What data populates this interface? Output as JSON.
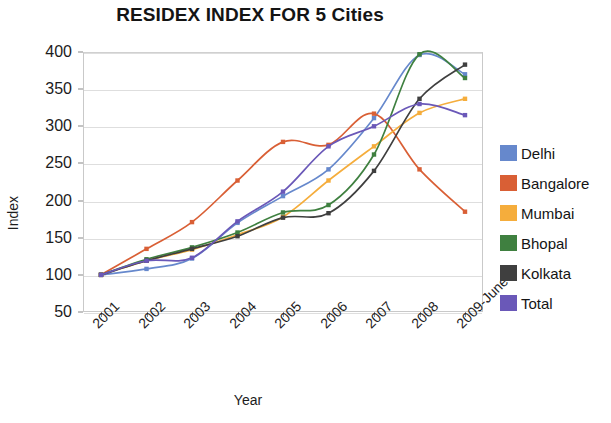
{
  "chart_data": {
    "type": "line",
    "title": "RESIDEX INDEX FOR 5 Cities",
    "xlabel": "Year",
    "ylabel": "Index",
    "categories": [
      "2001",
      "2002",
      "2003",
      "2004",
      "2005",
      "2006",
      "2007",
      "2008",
      "2009-June"
    ],
    "ylim": [
      50,
      400
    ],
    "yticks": [
      50,
      100,
      150,
      200,
      250,
      300,
      350,
      400
    ],
    "grid": true,
    "legend_position": "right",
    "markers": true,
    "series": [
      {
        "name": "Delhi",
        "color": "#6688cc",
        "values": [
          100,
          108,
          122,
          170,
          206,
          242,
          311,
          396,
          370
        ]
      },
      {
        "name": "Bangalore",
        "color": "#d95f35",
        "values": [
          100,
          135,
          171,
          227,
          279,
          275,
          317,
          242,
          185
        ]
      },
      {
        "name": "Mumbai",
        "color": "#f5ad3c",
        "values": [
          100,
          119,
          134,
          154,
          178,
          227,
          273,
          318,
          337
        ]
      },
      {
        "name": "Bhopal",
        "color": "#3f8040",
        "values": [
          100,
          121,
          137,
          157,
          184,
          194,
          262,
          397,
          365
        ]
      },
      {
        "name": "Kolkata",
        "color": "#3f3f3f",
        "values": [
          100,
          119,
          135,
          152,
          177,
          183,
          240,
          337,
          383
        ]
      },
      {
        "name": "Total",
        "color": "#6a58b8",
        "values": [
          100,
          119,
          123,
          172,
          212,
          273,
          300,
          330,
          315
        ]
      }
    ]
  },
  "legend": {
    "items": [
      {
        "label": "Delhi",
        "color": "#6688cc"
      },
      {
        "label": "Bangalore",
        "color": "#d95f35"
      },
      {
        "label": "Mumbai",
        "color": "#f5ad3c"
      },
      {
        "label": "Bhopal",
        "color": "#3f8040"
      },
      {
        "label": "Kolkata",
        "color": "#3f3f3f"
      },
      {
        "label": "Total",
        "color": "#6a58b8"
      }
    ]
  }
}
